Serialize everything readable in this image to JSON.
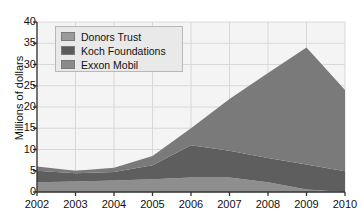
{
  "chart_data": {
    "type": "area",
    "stacked": true,
    "title": "",
    "subtitle": "",
    "xlabel": "",
    "ylabel": "Millions of dollars",
    "x": [
      2002,
      2003,
      2004,
      2005,
      2006,
      2007,
      2008,
      2009,
      2010
    ],
    "xticklabels": [
      "2002",
      "2003",
      "2004",
      "2005",
      "2006",
      "2007",
      "2008",
      "2009",
      "2010"
    ],
    "yticklabels": [
      "0",
      "5",
      "10",
      "15",
      "20",
      "25",
      "30",
      "35",
      "40"
    ],
    "yticks": [
      0,
      5,
      10,
      15,
      20,
      25,
      30,
      35,
      40
    ],
    "ylim": [
      0,
      40
    ],
    "xlim": [
      2002,
      2010
    ],
    "grid": true,
    "legend_position": "upper-left",
    "series": [
      {
        "name": "Exxon Mobil",
        "color": "#8e8e8e",
        "values": [
          2.3,
          2.5,
          2.7,
          3.0,
          3.4,
          3.4,
          2.3,
          0.6,
          0.0
        ]
      },
      {
        "name": "Koch Foundations",
        "color": "#5e5e5e",
        "values": [
          2.7,
          1.9,
          2.0,
          3.3,
          7.6,
          6.3,
          5.7,
          5.9,
          4.9
        ]
      },
      {
        "name": "Donors Trust",
        "color": "#7a7a7a",
        "values": [
          1.0,
          0.6,
          1.0,
          2.2,
          4.0,
          12.2,
          20.0,
          27.5,
          19.1
        ]
      }
    ],
    "totals": [
      6.0,
      5.0,
      5.7,
      8.5,
      15.0,
      21.9,
      28.0,
      34.0,
      24.0
    ]
  },
  "legend": {
    "items": [
      {
        "label": "Donors Trust",
        "color": "#9a9a9a"
      },
      {
        "label": "Koch Foundations",
        "color": "#5a5a5a"
      },
      {
        "label": "Exxon Mobil",
        "color": "#8a8a8a"
      }
    ]
  },
  "colors": {
    "plot_background": "#f4f4f4",
    "grid": "#d8d8d8",
    "axis": "#333333",
    "text": "#111111",
    "legend_background": "#e9e9e9",
    "legend_border": "#b8b8b8"
  }
}
